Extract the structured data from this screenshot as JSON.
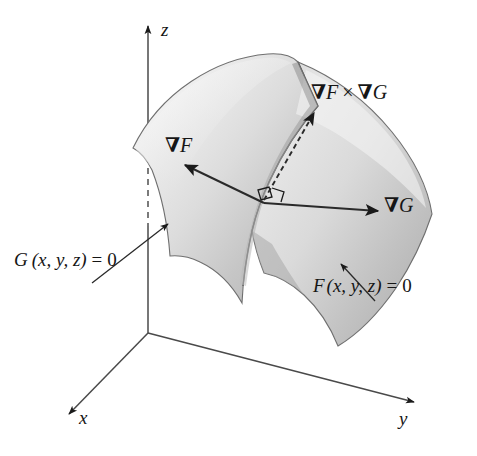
{
  "figure": {
    "background_color": "#ffffff",
    "ink_color": "#1a1a1a",
    "surface_light_color": "#f2f2f2",
    "surface_mid_color": "#cfcfcf",
    "surface_dark_color": "#a8a8a8"
  },
  "axes": {
    "z": {
      "label": "z",
      "direction": "up"
    },
    "x": {
      "label": "x",
      "direction": "down-left"
    },
    "y": {
      "label": "y",
      "direction": "right"
    },
    "origin": {
      "x": 148,
      "y": 332
    },
    "hidden_segment_style": "dashed"
  },
  "vectors": [
    {
      "id": "grad-f",
      "label_nabla": "∇",
      "label_var": "F",
      "style": "solid",
      "direction": "up-left",
      "description": "gradient of F, normal to surface F = 0"
    },
    {
      "id": "grad-g",
      "label_nabla": "∇",
      "label_var": "G",
      "style": "solid",
      "direction": "right",
      "description": "gradient of G, normal to surface G = 0"
    },
    {
      "id": "grad-f-cross-grad-g",
      "label_nabla": "∇",
      "label_var_1": "F",
      "label_op": "×",
      "label_var_2": "G",
      "style": "dashed",
      "direction": "up-right",
      "description": "cross product, tangent to the curve of intersection"
    }
  ],
  "right_angle_marker": {
    "present": true,
    "at_point": {
      "x": 262,
      "y": 200
    },
    "description": "small square indicating perpendicularity"
  },
  "surfaces": [
    {
      "id": "surface-g",
      "equation_func": "G",
      "equation_args": "(x, y, z)",
      "equation_rel": "=",
      "equation_rhs": "0",
      "equation_full": "G (x, y, z) = 0",
      "leader_arrow": "points up-right toward the left sheet"
    },
    {
      "id": "surface-f",
      "equation_func": "F",
      "equation_args": "(x, y, z)",
      "equation_rel": "=",
      "equation_rhs": "0",
      "equation_full": "F (x, y, z) = 0",
      "leader_arrow": "points up-left toward the right sheet"
    }
  ],
  "labels": {
    "z_axis": "z",
    "x_axis": "x",
    "y_axis": "y"
  }
}
